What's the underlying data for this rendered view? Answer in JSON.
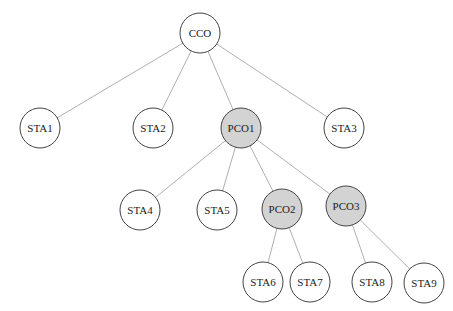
{
  "colors": {
    "coordinator_fill": "#d3d3d3",
    "station_fill": "#ffffff"
  },
  "nodes": [
    {
      "id": "CCO",
      "label": "CCO",
      "type": "station"
    },
    {
      "id": "STA1",
      "label": "STA1",
      "type": "station"
    },
    {
      "id": "STA2",
      "label": "STA2",
      "type": "station"
    },
    {
      "id": "PCO1",
      "label": "PCO1",
      "type": "coordinator"
    },
    {
      "id": "STA3",
      "label": "STA3",
      "type": "station"
    },
    {
      "id": "STA4",
      "label": "STA4",
      "type": "station"
    },
    {
      "id": "STA5",
      "label": "STA5",
      "type": "station"
    },
    {
      "id": "PCO2",
      "label": "PCO2",
      "type": "coordinator"
    },
    {
      "id": "PCO3",
      "label": "PCO3",
      "type": "coordinator"
    },
    {
      "id": "STA6",
      "label": "STA6",
      "type": "station"
    },
    {
      "id": "STA7",
      "label": "STA7",
      "type": "station"
    },
    {
      "id": "STA8",
      "label": "STA8",
      "type": "station"
    },
    {
      "id": "STA9",
      "label": "STA9",
      "type": "station"
    }
  ],
  "edges": [
    [
      "CCO",
      "STA1"
    ],
    [
      "CCO",
      "STA2"
    ],
    [
      "CCO",
      "PCO1"
    ],
    [
      "CCO",
      "STA3"
    ],
    [
      "PCO1",
      "STA4"
    ],
    [
      "PCO1",
      "STA5"
    ],
    [
      "PCO1",
      "PCO2"
    ],
    [
      "PCO1",
      "PCO3"
    ],
    [
      "PCO2",
      "STA6"
    ],
    [
      "PCO2",
      "STA7"
    ],
    [
      "PCO3",
      "STA8"
    ],
    [
      "PCO3",
      "STA9"
    ]
  ]
}
